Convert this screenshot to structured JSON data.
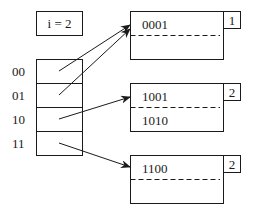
{
  "global_depth": {
    "label": "i = 2"
  },
  "directory": {
    "entries": [
      {
        "label": "00",
        "points_to": 0
      },
      {
        "label": "01",
        "points_to": 0
      },
      {
        "label": "10",
        "points_to": 1
      },
      {
        "label": "11",
        "points_to": 2
      }
    ]
  },
  "buckets": [
    {
      "local_depth": "1",
      "records": [
        "0001",
        ""
      ]
    },
    {
      "local_depth": "2",
      "records": [
        "1001",
        "1010"
      ]
    },
    {
      "local_depth": "2",
      "records": [
        "1100",
        ""
      ]
    }
  ],
  "colors": {
    "stroke": "#1a1a1a",
    "background": "#ffffff"
  }
}
